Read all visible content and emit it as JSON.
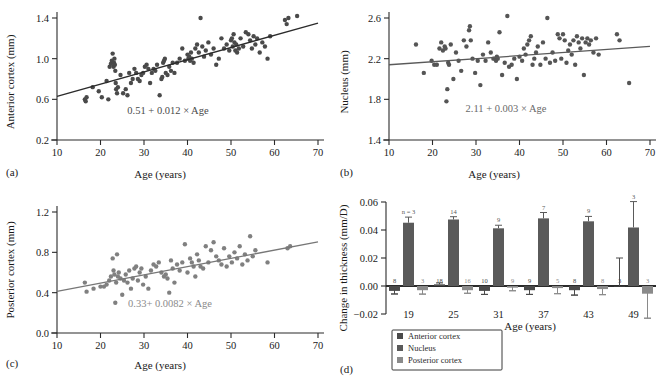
{
  "figure": {
    "panels": [
      "(a)",
      "(b)",
      "(c)",
      "(d)"
    ]
  },
  "chart_data": [
    {
      "panel": "(a)",
      "type": "scatter",
      "title": "",
      "xlabel": "Age (years)",
      "ylabel": "Anterior cortex (mm)",
      "xlim": [
        10,
        70
      ],
      "ylim": [
        0.2,
        1.4
      ],
      "xticks": [
        10,
        20,
        30,
        40,
        50,
        60,
        70
      ],
      "yticks": [
        0.2,
        0.6,
        1.0,
        1.4
      ],
      "grid": false,
      "annotation": "0.51 + 0.012 × Age",
      "fit": {
        "intercept": 0.51,
        "slope": 0.012
      },
      "point_color": "#4a4a4a",
      "line_color": "#2b2b2b",
      "x": [
        16.4,
        16.6,
        16.8,
        18.2,
        19.6,
        20.3,
        21.4,
        21.8,
        22.1,
        22.4,
        22.6,
        22.8,
        23.0,
        23.1,
        23.2,
        23.3,
        23.4,
        23.5,
        23.6,
        23.8,
        24.0,
        24.6,
        25.2,
        25.8,
        26.2,
        26.6,
        27.0,
        27.4,
        27.8,
        28.2,
        28.6,
        29.0,
        29.4,
        29.8,
        30.2,
        30.6,
        31.0,
        31.4,
        31.8,
        32.2,
        32.6,
        33.0,
        33.6,
        34.0,
        34.2,
        34.4,
        34.6,
        34.8,
        35.0,
        35.4,
        35.8,
        36.2,
        36.6,
        37.0,
        37.6,
        38.2,
        38.8,
        39.4,
        40.0,
        40.2,
        40.4,
        40.6,
        40.8,
        41.0,
        41.4,
        41.8,
        42.2,
        42.6,
        43.0,
        43.4,
        43.8,
        44.2,
        44.8,
        45.4,
        46.0,
        46.6,
        47.2,
        47.8,
        48.4,
        49.0,
        49.6,
        50.0,
        50.2,
        50.4,
        50.6,
        50.8,
        51.0,
        51.2,
        51.4,
        51.8,
        52.2,
        52.8,
        53.4,
        54.0,
        54.4,
        54.8,
        55.2,
        55.6,
        56.0,
        56.6,
        57.2,
        57.8,
        58.4,
        59.0,
        62.4,
        62.8,
        63.2,
        65.2
      ],
      "y": [
        0.6,
        0.58,
        0.62,
        0.72,
        0.68,
        0.62,
        0.78,
        0.6,
        0.92,
        0.95,
        0.98,
        1.05,
        0.92,
        0.96,
        1.0,
        0.94,
        0.88,
        0.76,
        0.7,
        0.66,
        0.72,
        0.84,
        0.66,
        0.7,
        0.64,
        0.86,
        0.76,
        0.8,
        0.9,
        0.86,
        0.8,
        0.78,
        0.84,
        0.86,
        0.92,
        0.94,
        0.9,
        0.76,
        0.86,
        0.9,
        0.88,
        0.94,
        0.64,
        0.8,
        0.82,
        0.96,
        0.98,
        1.0,
        0.86,
        0.84,
        0.92,
        0.88,
        0.96,
        0.86,
        0.96,
        1.0,
        1.1,
        0.98,
        1.04,
        1.0,
        1.02,
        0.98,
        1.06,
        1.0,
        0.96,
        1.1,
        1.14,
        1.06,
        1.4,
        1.12,
        1.02,
        1.08,
        1.16,
        1.04,
        1.1,
        0.94,
        1.0,
        1.2,
        1.1,
        1.14,
        1.08,
        1.18,
        1.2,
        1.12,
        1.24,
        1.16,
        1.08,
        1.14,
        1.06,
        1.1,
        1.2,
        1.12,
        1.26,
        1.24,
        1.18,
        1.1,
        1.22,
        1.14,
        1.2,
        1.06,
        1.16,
        1.12,
        1.0,
        1.22,
        1.38,
        1.34,
        1.4,
        1.42
      ]
    },
    {
      "panel": "(b)",
      "type": "scatter",
      "title": "",
      "xlabel": "Age (years)",
      "ylabel": "Nucleus (mm)",
      "xlim": [
        10,
        70
      ],
      "ylim": [
        1.4,
        2.6
      ],
      "xticks": [
        10,
        20,
        30,
        40,
        50,
        60,
        70
      ],
      "yticks": [
        1.4,
        1.8,
        2.2,
        2.6
      ],
      "grid": false,
      "annotation": "2.11 + 0.003 × Age",
      "fit": {
        "intercept": 2.11,
        "slope": 0.003
      },
      "point_color": "#555555",
      "line_color": "#5a5a5a",
      "x": [
        16.2,
        18.0,
        19.8,
        20.4,
        21.0,
        21.6,
        22.0,
        22.4,
        22.8,
        23.0,
        23.2,
        23.4,
        23.6,
        23.8,
        24.2,
        24.8,
        25.4,
        26.0,
        26.6,
        27.2,
        27.8,
        28.4,
        28.6,
        28.8,
        29.2,
        29.8,
        30.4,
        31.0,
        31.6,
        32.2,
        32.8,
        33.4,
        34.0,
        34.4,
        34.6,
        34.8,
        35.0,
        35.4,
        36.0,
        36.6,
        37.2,
        37.6,
        38.2,
        38.8,
        39.4,
        40.0,
        40.6,
        41.0,
        41.4,
        41.8,
        42.2,
        42.6,
        43.0,
        43.4,
        43.8,
        44.2,
        44.8,
        45.4,
        46.0,
        46.4,
        47.0,
        47.6,
        48.2,
        48.8,
        49.2,
        49.6,
        50.0,
        50.4,
        50.8,
        51.2,
        51.6,
        52.0,
        52.4,
        52.8,
        53.2,
        53.6,
        54.0,
        54.4,
        54.8,
        55.2,
        55.6,
        56.0,
        56.4,
        57.0,
        57.6,
        58.2,
        62.4,
        63.0,
        65.2
      ],
      "y": [
        2.34,
        2.06,
        2.18,
        2.14,
        2.14,
        2.3,
        2.36,
        2.28,
        2.32,
        2.3,
        1.78,
        1.9,
        2.16,
        2.14,
        2.34,
        2.0,
        2.26,
        2.18,
        2.08,
        2.38,
        2.32,
        2.48,
        2.52,
        2.38,
        2.2,
        2.06,
        2.18,
        1.94,
        2.24,
        2.18,
        2.36,
        2.26,
        2.2,
        2.2,
        2.18,
        2.22,
        2.2,
        2.46,
        2.04,
        2.16,
        2.62,
        2.12,
        2.14,
        2.2,
        2.0,
        2.22,
        2.18,
        2.3,
        2.24,
        2.34,
        2.38,
        2.42,
        2.14,
        2.2,
        2.26,
        2.32,
        2.14,
        2.36,
        2.2,
        2.6,
        2.16,
        2.26,
        2.18,
        2.44,
        2.4,
        2.2,
        2.44,
        2.38,
        2.16,
        2.28,
        2.34,
        2.24,
        2.38,
        2.14,
        2.42,
        2.36,
        2.3,
        2.4,
        2.04,
        2.36,
        2.4,
        2.34,
        2.38,
        2.26,
        2.4,
        2.24,
        2.44,
        2.38,
        1.96
      ]
    },
    {
      "panel": "(c)",
      "type": "scatter",
      "title": "",
      "xlabel": "Age (years)",
      "ylabel": "Posterior cortex (mm)",
      "xlim": [
        10,
        70
      ],
      "ylim": [
        0.0,
        1.2
      ],
      "xticks": [
        10,
        20,
        30,
        40,
        50,
        60,
        70
      ],
      "yticks": [
        0.0,
        0.4,
        0.8,
        1.2
      ],
      "grid": false,
      "annotation": "0.33+ 0.0082 × Age",
      "fit": {
        "intercept": 0.33,
        "slope": 0.0082
      },
      "point_color": "#808080",
      "line_color": "#777777",
      "x": [
        16.4,
        16.8,
        18.4,
        20.0,
        20.8,
        21.4,
        22.0,
        22.4,
        22.8,
        23.0,
        23.2,
        23.4,
        23.6,
        23.8,
        24.0,
        24.2,
        24.6,
        25.0,
        25.4,
        25.8,
        26.2,
        26.6,
        27.0,
        27.4,
        27.8,
        28.2,
        28.6,
        29.0,
        29.4,
        29.8,
        30.4,
        31.0,
        31.6,
        32.2,
        32.8,
        33.4,
        34.0,
        34.6,
        35.0,
        35.4,
        35.8,
        36.2,
        36.6,
        37.0,
        37.6,
        38.2,
        38.8,
        39.4,
        40.0,
        40.6,
        41.0,
        41.4,
        41.8,
        42.2,
        42.6,
        43.0,
        43.6,
        44.2,
        44.8,
        45.4,
        46.0,
        46.6,
        47.2,
        47.8,
        48.4,
        49.0,
        49.6,
        50.2,
        50.8,
        51.4,
        52.0,
        52.6,
        53.2,
        53.8,
        54.4,
        55.0,
        55.6,
        58.4,
        63.0,
        63.6
      ],
      "y": [
        0.5,
        0.41,
        0.44,
        0.46,
        0.46,
        0.48,
        0.52,
        0.56,
        0.74,
        0.62,
        0.58,
        0.3,
        0.5,
        0.78,
        0.56,
        0.6,
        0.54,
        0.38,
        0.52,
        0.58,
        0.5,
        0.62,
        0.44,
        0.54,
        0.64,
        0.66,
        0.52,
        0.6,
        0.64,
        0.48,
        0.56,
        0.44,
        0.62,
        0.68,
        0.66,
        0.7,
        0.6,
        0.56,
        0.58,
        0.54,
        0.4,
        0.72,
        0.64,
        0.5,
        0.68,
        0.62,
        0.7,
        0.88,
        0.6,
        0.74,
        0.7,
        0.66,
        0.56,
        0.78,
        0.72,
        0.66,
        0.64,
        0.86,
        0.7,
        0.82,
        0.9,
        0.76,
        0.72,
        0.68,
        0.84,
        0.66,
        0.76,
        0.7,
        0.8,
        0.74,
        0.86,
        0.68,
        0.78,
        0.72,
        0.96,
        0.76,
        0.82,
        0.7,
        0.84,
        0.86
      ]
    },
    {
      "panel": "(d)",
      "type": "bar",
      "title": "",
      "xlabel": "Age (years)",
      "ylabel": "Change in thickness (mm/D)",
      "categories": [
        "19",
        "25",
        "31",
        "37",
        "43",
        "49"
      ],
      "ylim": [
        -0.02,
        0.06
      ],
      "yticks": [
        "0.06",
        "0.04",
        "0.02",
        "0.00",
        "−0.02"
      ],
      "ytick_values": [
        0.06,
        0.04,
        0.02,
        0.0,
        -0.02
      ],
      "grid": false,
      "legend_position": "bottom-left",
      "series": [
        {
          "name": "Anterior cortex",
          "color": "#4a4a4a",
          "values": [
            -0.0035,
            0.0012,
            -0.0035,
            -0.003,
            -0.003,
            0.0
          ],
          "errors": [
            0.0022,
            0.001,
            0.0025,
            0.003,
            0.0035,
            0.02
          ],
          "n": [
            "8",
            "18",
            "10",
            "9",
            "8",
            "3"
          ]
        },
        {
          "name": "Nucleus",
          "color": "#5a5a5a",
          "values": [
            0.0452,
            0.0475,
            0.0412,
            0.0483,
            0.0462,
            0.0418
          ],
          "errors": [
            0.004,
            0.002,
            0.0022,
            0.0042,
            0.0035,
            0.0185
          ],
          "n": [
            "n = 3",
            "14",
            "9",
            "7",
            "9",
            "3"
          ]
        },
        {
          "name": "Posterior cortex",
          "color": "#8a8a8a",
          "values": [
            -0.003,
            -0.003,
            -0.0012,
            -0.0015,
            -0.0022,
            -0.0055
          ],
          "errors": [
            0.0028,
            0.0022,
            0.0022,
            0.004,
            0.004,
            0.0175
          ],
          "n": [
            "3",
            "16",
            "9",
            "5",
            "8",
            "3"
          ]
        }
      ]
    }
  ]
}
